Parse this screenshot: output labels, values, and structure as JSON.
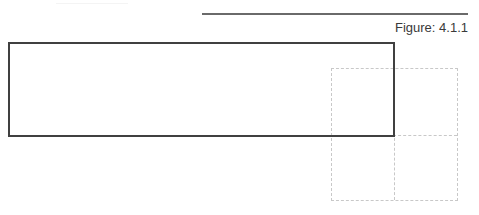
{
  "figure": {
    "label": "Figure: 4.1.1"
  },
  "colors": {
    "rule": "#6a6a6a",
    "rectangle_border": "#404040",
    "dashed_grid": "#c8c8c8",
    "text": "#3a3a3a"
  }
}
